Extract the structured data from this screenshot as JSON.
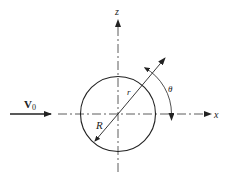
{
  "diagram": {
    "labels": {
      "velocity": "V",
      "velocity_subscript": "0",
      "z_axis": "z",
      "x_axis": "x",
      "radius_big": "R",
      "radius_small": "r",
      "angle": "θ"
    },
    "geometry": {
      "center": [
        118,
        114
      ],
      "sphere_radius": 38,
      "radial_angle_deg": 60,
      "stroke_color": "#222222"
    }
  }
}
